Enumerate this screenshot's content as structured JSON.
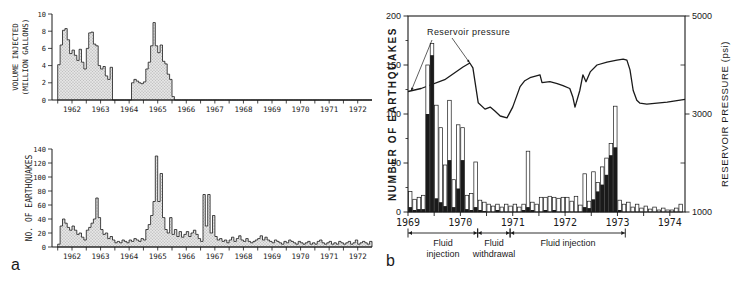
{
  "figure": {
    "panel_a_letter": "a",
    "panel_b_letter": "b"
  },
  "colors": {
    "ink": "#1a1a1a",
    "paper": "#ffffff",
    "area_fill": "#e4e4e4",
    "area_dot": "#9a9a9a",
    "bar_open_fill": "#ffffff",
    "bar_solid_fill": "#1a1a1a"
  },
  "chart_data": [
    {
      "id": "volume-injected",
      "type": "area",
      "panel": "a",
      "ylabel_lines": [
        "VOLUME INJECTED",
        "(MILLION GALLONS)"
      ],
      "ylim": [
        0,
        10
      ],
      "yticks": [
        0,
        2,
        4,
        6,
        8,
        10
      ],
      "x_start_year": 1962,
      "xtick_years": [
        "1962",
        "1963",
        "1964",
        "1965",
        "1966",
        "1967",
        "1968",
        "1969",
        "1970",
        "1971",
        "1972"
      ],
      "values_monthly_by_year": [
        [
          4.1,
          6.4,
          8.1,
          8.3,
          7.0,
          5.4,
          5.8,
          5.2,
          4.6,
          5.9,
          4.4,
          3.6
        ],
        [
          6.0,
          7.8,
          7.9,
          6.5,
          6.3,
          4.0,
          3.6,
          3.9,
          2.8,
          2.4,
          3.8,
          0
        ],
        [
          0,
          0,
          0,
          0,
          0,
          0,
          0,
          2.0,
          2.4,
          2.2,
          2.0,
          1.9
        ],
        [
          2.1,
          3.6,
          4.4,
          6.3,
          9.0,
          6.3,
          5.5,
          6.4,
          4.5,
          4.2,
          3.0,
          2.4
        ],
        [
          0.4,
          0,
          0,
          0,
          0,
          0,
          0,
          0,
          0,
          0,
          0,
          0
        ],
        [
          0,
          0,
          0,
          0,
          0,
          0,
          0,
          0,
          0,
          0,
          0,
          0
        ],
        [
          0,
          0,
          0,
          0,
          0,
          0,
          0,
          0,
          0,
          0,
          0,
          0
        ],
        [
          0,
          0,
          0,
          0,
          0,
          0,
          0,
          0,
          0,
          0,
          0,
          0
        ],
        [
          0,
          0,
          0,
          0,
          0,
          0,
          0,
          0,
          0,
          0,
          0,
          0
        ],
        [
          0,
          0,
          0,
          0,
          0,
          0,
          0,
          0,
          0,
          0,
          0,
          0
        ],
        [
          0,
          0,
          0,
          0,
          0,
          0,
          0,
          0,
          0,
          0,
          0,
          0
        ]
      ]
    },
    {
      "id": "earthquakes-a",
      "type": "area",
      "panel": "a",
      "ylabel": "NO. OF EARTHQUAKES",
      "ylim": [
        0,
        140
      ],
      "yticks": [
        0,
        20,
        40,
        60,
        80,
        100,
        120,
        140
      ],
      "x_start_year": 1962,
      "xtick_years": [
        "1962",
        "1963",
        "1964",
        "1965",
        "1966",
        "1967",
        "1968",
        "1969",
        "1970",
        "1971",
        "1972"
      ],
      "values_monthly_by_year": [
        [
          4,
          30,
          40,
          34,
          28,
          24,
          30,
          24,
          18,
          20,
          14,
          10
        ],
        [
          24,
          28,
          34,
          40,
          70,
          42,
          25,
          18,
          20,
          12,
          15,
          10
        ],
        [
          6,
          8,
          6,
          10,
          8,
          6,
          10,
          8,
          12,
          10,
          8,
          12
        ],
        [
          10,
          25,
          32,
          45,
          65,
          130,
          65,
          105,
          42,
          25,
          20,
          42
        ],
        [
          18,
          25,
          15,
          22,
          14,
          18,
          22,
          15,
          20,
          24,
          18,
          12
        ],
        [
          8,
          75,
          30,
          75,
          20,
          45,
          15,
          10,
          12,
          8,
          10,
          6
        ],
        [
          10,
          14,
          8,
          12,
          16,
          10,
          8,
          12,
          8,
          6,
          8,
          10
        ],
        [
          12,
          16,
          10,
          14,
          10,
          8,
          6,
          10,
          8,
          6,
          4,
          8
        ],
        [
          6,
          10,
          8,
          6,
          4,
          8,
          6,
          4,
          6,
          8,
          4,
          6
        ],
        [
          4,
          8,
          10,
          6,
          4,
          6,
          8,
          4,
          6,
          4,
          8,
          6
        ],
        [
          4,
          6,
          8,
          4,
          6,
          10,
          4,
          6,
          8,
          6,
          4,
          8
        ]
      ]
    },
    {
      "id": "earthquakes-pressure-b",
      "type": "stacked-bar-line",
      "panel": "b",
      "ylabel_left": "NUMBER OF EARTHQUAKES",
      "ylabel_right": "RESERVOIR PRESSURE (psi)",
      "ylim_left": [
        0,
        200
      ],
      "yticks_left": [
        0,
        50,
        100,
        150,
        200
      ],
      "yticks_left_minor": [
        25,
        75,
        125,
        175
      ],
      "ylim_right": [
        1000,
        5000
      ],
      "yticks_right": [
        1000,
        3000,
        5000
      ],
      "yticks_right_minor": [
        2000,
        4000
      ],
      "x_start_year": 1969,
      "xtick_years": [
        "1969",
        "1970",
        "1971",
        "1972",
        "1973",
        "1974"
      ],
      "bars_monthly_by_year": [
        [
          [
            21,
            5
          ],
          [
            13,
            2
          ],
          [
            15,
            3
          ],
          [
            17,
            3
          ],
          [
            150,
            100
          ],
          [
            172,
            160
          ],
          [
            109,
            14
          ],
          [
            86,
            10
          ],
          [
            48,
            6
          ],
          [
            114,
            53
          ],
          [
            33,
            5
          ],
          [
            89,
            24
          ]
        ],
        [
          [
            86,
            53
          ],
          [
            17,
            3
          ],
          [
            19,
            2
          ],
          [
            51,
            5
          ],
          [
            12,
            2
          ],
          [
            10,
            1
          ],
          [
            8,
            0
          ],
          [
            6,
            0
          ],
          [
            8,
            2
          ],
          [
            5,
            0
          ],
          [
            8,
            0
          ],
          [
            6,
            0
          ]
        ],
        [
          [
            8,
            0
          ],
          [
            5,
            0
          ],
          [
            8,
            2
          ],
          [
            62,
            5
          ],
          [
            10,
            2
          ],
          [
            8,
            0
          ],
          [
            15,
            0
          ],
          [
            15,
            2
          ],
          [
            16,
            0
          ],
          [
            15,
            2
          ],
          [
            14,
            0
          ],
          [
            15,
            0
          ]
        ],
        [
          [
            15,
            0
          ],
          [
            11,
            0
          ],
          [
            16,
            0
          ],
          [
            7,
            0
          ],
          [
            39,
            5
          ],
          [
            11,
            4
          ],
          [
            41,
            13
          ],
          [
            30,
            21
          ],
          [
            46,
            28
          ],
          [
            55,
            38
          ],
          [
            70,
            58
          ],
          [
            108,
            66
          ]
        ],
        [
          [
            12,
            2
          ],
          [
            8,
            0
          ],
          [
            10,
            0
          ],
          [
            5,
            0
          ],
          [
            8,
            0
          ],
          [
            4,
            0
          ],
          [
            6,
            0
          ],
          [
            3,
            0
          ],
          [
            5,
            0
          ],
          [
            2,
            0
          ],
          [
            4,
            0
          ],
          [
            2,
            0
          ]
        ],
        [
          [
            2,
            0
          ],
          [
            4,
            0
          ],
          [
            8,
            0
          ]
        ]
      ],
      "pressure_line": [
        [
          1969.0,
          3460
        ],
        [
          1969.25,
          3520
        ],
        [
          1969.7,
          3700
        ],
        [
          1970.05,
          3960
        ],
        [
          1970.18,
          4040
        ],
        [
          1970.24,
          3940
        ],
        [
          1970.34,
          3230
        ],
        [
          1970.47,
          3100
        ],
        [
          1970.57,
          3140
        ],
        [
          1970.66,
          3060
        ],
        [
          1970.76,
          2960
        ],
        [
          1970.89,
          2920
        ],
        [
          1971.0,
          3140
        ],
        [
          1971.14,
          3560
        ],
        [
          1971.23,
          3680
        ],
        [
          1971.33,
          3740
        ],
        [
          1971.52,
          3800
        ],
        [
          1971.56,
          3640
        ],
        [
          1971.71,
          3660
        ],
        [
          1971.85,
          3620
        ],
        [
          1971.96,
          3580
        ],
        [
          1972.09,
          3520
        ],
        [
          1972.15,
          3340
        ],
        [
          1972.19,
          3140
        ],
        [
          1972.28,
          3480
        ],
        [
          1972.34,
          3800
        ],
        [
          1972.4,
          3660
        ],
        [
          1972.48,
          3860
        ],
        [
          1972.61,
          4000
        ],
        [
          1972.8,
          4060
        ],
        [
          1972.99,
          4100
        ],
        [
          1973.11,
          4120
        ],
        [
          1973.18,
          4100
        ],
        [
          1973.24,
          3900
        ],
        [
          1973.3,
          3480
        ],
        [
          1973.37,
          3280
        ],
        [
          1973.43,
          3220
        ],
        [
          1973.56,
          3200
        ],
        [
          1973.95,
          3240
        ],
        [
          1974.29,
          3300
        ]
      ],
      "annotation": {
        "text": "Reservoir pressure",
        "arrows": [
          {
            "year": 1969.06,
            "psi": 3470
          },
          {
            "year": 1970.18,
            "psi": 4040
          }
        ]
      },
      "brackets": [
        {
          "lines": [
            "Fluid",
            "injection"
          ],
          "from": 1969.0,
          "to": 1970.33
        },
        {
          "lines": [
            "Fluid",
            "withdrawal"
          ],
          "from": 1970.33,
          "to": 1970.95
        },
        {
          "lines": [
            "Fluid injection"
          ],
          "from": 1970.95,
          "to": 1973.15
        }
      ]
    }
  ]
}
